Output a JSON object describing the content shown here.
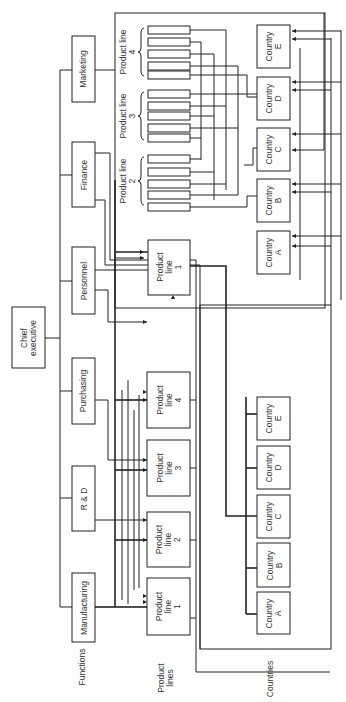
{
  "chief": {
    "label": "Chief\nexecutive"
  },
  "functions": {
    "heading": "Functions",
    "items": [
      {
        "label": "Marketing"
      },
      {
        "label": "Finance"
      },
      {
        "label": "Personnel"
      },
      {
        "label": "Purchasing"
      },
      {
        "label": "R & D"
      },
      {
        "label": "Manufacturing"
      }
    ]
  },
  "product_lines": {
    "heading": "Product\nlines",
    "items": [
      {
        "label": "Product\nline\n1"
      },
      {
        "label": "Product\nline\n2"
      },
      {
        "label": "Product\nline\n3"
      },
      {
        "label": "Product\nline\n4"
      }
    ]
  },
  "countries": {
    "heading": "Countries",
    "items": [
      {
        "label": "Country\nA"
      },
      {
        "label": "Country\nB"
      },
      {
        "label": "Country\nC"
      },
      {
        "label": "Country\nD"
      },
      {
        "label": "Country\nE"
      }
    ]
  },
  "matrix": {
    "product_line_1": {
      "label": "Product\nline\n1"
    },
    "groups": [
      {
        "label": "Product line\n2"
      },
      {
        "label": "Product line\n3"
      },
      {
        "label": "Product line\n4"
      }
    ],
    "countries": [
      {
        "label": "Country\nA"
      },
      {
        "label": "Country\nB"
      },
      {
        "label": "Country\nC"
      },
      {
        "label": "Country\nD"
      },
      {
        "label": "Country\nE"
      }
    ]
  }
}
